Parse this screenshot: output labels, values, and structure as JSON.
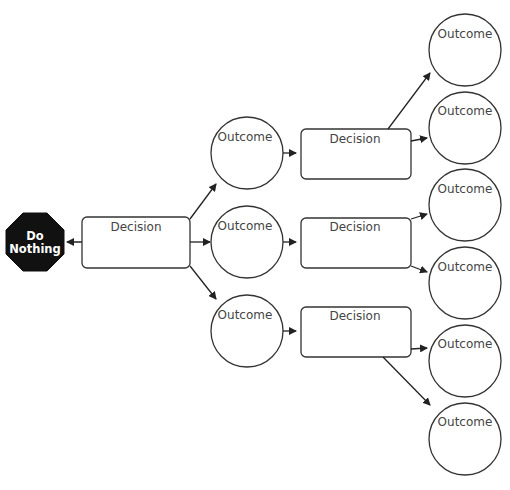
{
  "diagram": {
    "type": "decision-tree",
    "colors": {
      "stroke": "#333333",
      "text": "#444444",
      "stop_fill": "#111111",
      "stop_text": "#ffffff",
      "background": "#ffffff"
    },
    "stop_sign": {
      "line1": "Do",
      "line2": "Nothing"
    },
    "root_decision": {
      "label": "Decision"
    },
    "level1_outcomes": [
      {
        "label": "Outcome"
      },
      {
        "label": "Outcome"
      },
      {
        "label": "Outcome"
      }
    ],
    "level2_decisions": [
      {
        "label": "Decision"
      },
      {
        "label": "Decision"
      },
      {
        "label": "Decision"
      }
    ],
    "level3_outcomes": [
      {
        "label": "Outcome"
      },
      {
        "label": "Outcome"
      },
      {
        "label": "Outcome"
      },
      {
        "label": "Outcome"
      },
      {
        "label": "Outcome"
      },
      {
        "label": "Outcome"
      }
    ]
  }
}
